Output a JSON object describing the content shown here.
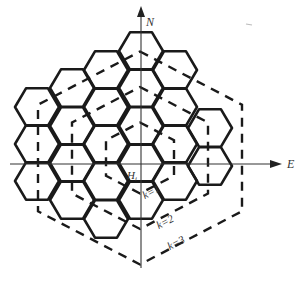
{
  "diagram": {
    "type": "hexagonal-grid",
    "axes": {
      "north_label": "N",
      "east_label": "E"
    },
    "center_label": "H",
    "center_label_subscript": "i",
    "rings": [
      {
        "label": "k=1",
        "k": 1
      },
      {
        "label": "k=2",
        "k": 2
      },
      {
        "label": "k=3",
        "k": 3
      }
    ],
    "grid_columns": [
      {
        "x": 37,
        "centers_y": [
          107,
          144,
          181
        ]
      },
      {
        "x": 72,
        "centers_y": [
          88,
          126,
          163,
          200
        ]
      },
      {
        "x": 106,
        "centers_y": [
          70,
          107,
          144,
          181,
          219
        ]
      },
      {
        "x": 141,
        "centers_y": [
          51,
          88,
          126,
          163,
          200
        ]
      },
      {
        "x": 175,
        "centers_y": [
          70,
          107,
          144,
          181
        ]
      },
      {
        "x": 210,
        "centers_y": [
          128,
          166
        ]
      }
    ],
    "stroke_color": "#1a1a1a",
    "background": "#ffffff"
  }
}
